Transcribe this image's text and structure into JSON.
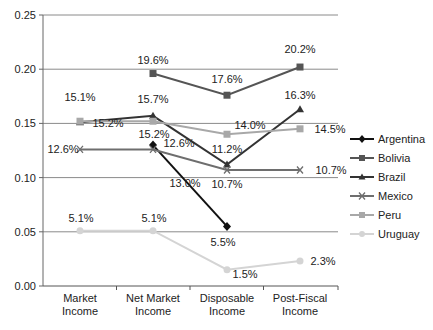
{
  "chart_data": {
    "type": "line",
    "title": "",
    "xlabel": "",
    "ylabel": "",
    "ylim": [
      0,
      0.25
    ],
    "yticks": [
      "0.00",
      "0.05",
      "0.10",
      "0.15",
      "0.20",
      "0.25"
    ],
    "grid": true,
    "legend_position": "right",
    "categories": [
      "Market Income",
      "Net Market Income",
      "Disposable Income",
      "Post-Fiscal Income"
    ],
    "category_lines": [
      [
        "Market",
        "Income"
      ],
      [
        "Net Market",
        "Income"
      ],
      [
        "Disposable",
        "Income"
      ],
      [
        "Post-Fiscal",
        "Income"
      ]
    ],
    "series": [
      {
        "name": "Argentina",
        "marker": "diamond",
        "color": "#111111",
        "values": [
          null,
          0.13,
          0.055,
          null
        ],
        "labels": [
          null,
          "13.0%",
          "5.5%",
          null
        ]
      },
      {
        "name": "Bolivia",
        "marker": "square",
        "color": "#555555",
        "values": [
          null,
          0.196,
          0.176,
          0.202
        ],
        "labels": [
          null,
          "19.6%",
          "17.6%",
          "20.2%"
        ]
      },
      {
        "name": "Brazil",
        "marker": "triangle",
        "color": "#333333",
        "values": [
          0.151,
          0.157,
          0.112,
          0.163
        ],
        "labels": [
          "15.1%",
          "15.7%",
          "11.2%",
          "16.3%"
        ]
      },
      {
        "name": "Mexico",
        "marker": "x",
        "color": "#6e6e6e",
        "values": [
          0.126,
          0.126,
          0.107,
          0.107
        ],
        "labels": [
          "12.6%",
          "12.6%",
          "10.7%",
          "10.7%"
        ]
      },
      {
        "name": "Peru",
        "marker": "square",
        "color": "#a8a8a8",
        "values": [
          0.152,
          0.152,
          0.14,
          0.145
        ],
        "labels": [
          "15.2%",
          "15.2%",
          "14.0%",
          "14.5%"
        ]
      },
      {
        "name": "Uruguay",
        "marker": "circle",
        "color": "#d4d4d4",
        "values": [
          0.051,
          0.051,
          0.015,
          0.023
        ],
        "labels": [
          "5.1%",
          "5.1%",
          "1.5%",
          "2.3%"
        ]
      }
    ]
  }
}
